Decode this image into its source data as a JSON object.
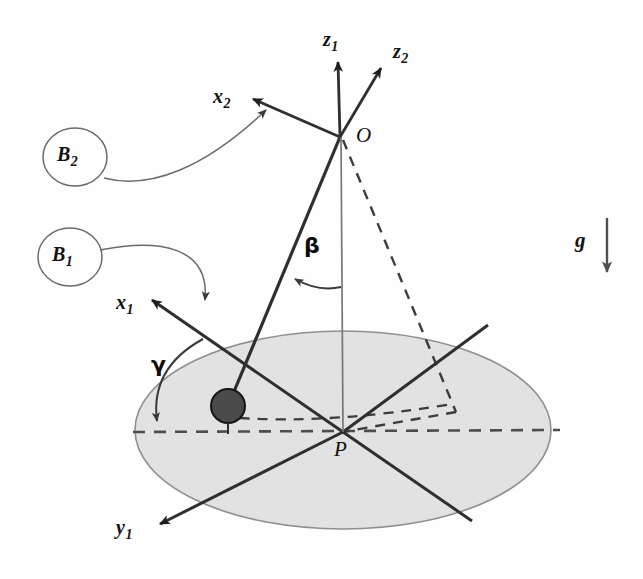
{
  "figure": {
    "kind": "mechanics-kinematics-diagram",
    "background_color": "#fefefe",
    "line_color": "#2f2f2f",
    "disk_fill_color": "#e0e0e0",
    "disk_edge_color": "#8a8a8a",
    "particle_fill_color": "#4a4a4a",
    "particle_edge_color": "#1a1a1a"
  },
  "axes": [
    {
      "id": "z1",
      "base": "z",
      "sub": "1",
      "label": "z1",
      "x": 323,
      "y": 28
    },
    {
      "id": "z2",
      "base": "z",
      "sub": "2",
      "label": "z2",
      "x": 393,
      "y": 40
    },
    {
      "id": "x2",
      "base": "x",
      "sub": "2",
      "label": "x2",
      "x": 213,
      "y": 85
    },
    {
      "id": "x1",
      "base": "x",
      "sub": "1",
      "label": "x1",
      "x": 116,
      "y": 291
    },
    {
      "id": "y1",
      "base": "y",
      "sub": "1",
      "label": "y1",
      "x": 116,
      "y": 516
    }
  ],
  "points": [
    {
      "id": "O",
      "label": "O",
      "x": 356,
      "y": 123
    },
    {
      "id": "P",
      "label": "P",
      "x": 334,
      "y": 437
    }
  ],
  "bodies": [
    {
      "id": "B2",
      "base": "B",
      "sub": "2",
      "label": "B2",
      "x": 47,
      "y": 133,
      "cx": 75,
      "cy": 157,
      "rx": 32,
      "ry": 29
    },
    {
      "id": "B1",
      "base": "B",
      "sub": "1",
      "label": "B1",
      "x": 41,
      "y": 233,
      "cx": 70,
      "cy": 257,
      "rx": 32,
      "ry": 29
    }
  ],
  "angles": [
    {
      "id": "beta",
      "label": "β",
      "x": 304,
      "y": 233
    },
    {
      "id": "gamma",
      "label": "γ",
      "x": 151,
      "y": 352
    }
  ],
  "gravity": {
    "id": "g",
    "label": "g",
    "x": 575,
    "y": 228,
    "arrow_x": 607,
    "arrow_top_y": 218,
    "arrow_bottom_y": 272
  },
  "geometry": {
    "disk": {
      "cx": 343,
      "cy": 430,
      "rx": 208,
      "ry": 99
    },
    "particle": {
      "cx": 228,
      "cy": 406,
      "r": 17
    },
    "origin_O": {
      "x": 340,
      "y": 136
    },
    "center_P": {
      "x": 343,
      "y": 432
    }
  }
}
